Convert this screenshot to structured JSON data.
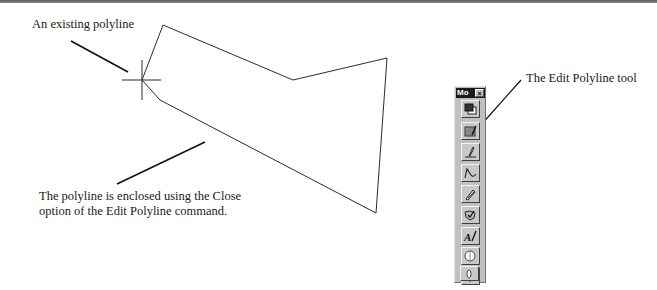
{
  "figure": {
    "callouts": {
      "existing_polyline": "An existing polyline",
      "enclosed_line1": "The polyline is enclosed using the Close",
      "enclosed_line2": "option of the Edit Polyline command.",
      "edit_polyline_tool": "The Edit Polyline tool"
    },
    "polyline": {
      "points": [
        [
          163,
          25
        ],
        [
          293,
          80
        ],
        [
          387,
          58
        ],
        [
          376,
          213
        ],
        [
          160,
          100
        ],
        [
          142,
          80
        ]
      ],
      "stroke": "#2b2b2b"
    },
    "crosshair": {
      "x": 142,
      "y": 80
    }
  },
  "toolbar": {
    "title": "Mo",
    "close_glyph": "×",
    "buttons": [
      {
        "name": "draw-order-button",
        "icon": "stacked-squares-icon"
      },
      {
        "name": "edit-hatch-button",
        "icon": "hatch-edit-icon"
      },
      {
        "name": "edit-polyline-button",
        "icon": "polyline-edit-icon"
      },
      {
        "name": "edit-spline-button",
        "icon": "spline-edit-icon"
      },
      {
        "name": "edit-multiline-button",
        "icon": "multiline-edit-icon"
      },
      {
        "name": "edit-attribute-button",
        "icon": "attribute-edit-icon"
      },
      {
        "name": "edit-text-button",
        "icon": "text-edit-icon"
      },
      {
        "name": "union-button",
        "icon": "union-icon"
      },
      {
        "name": "subtract-button",
        "icon": "subtract-icon"
      },
      {
        "name": "intersect-button",
        "icon": "intersect-icon"
      }
    ],
    "colors": {
      "face": "#c0c0c0",
      "titlebar": "#1a1a1a"
    }
  }
}
